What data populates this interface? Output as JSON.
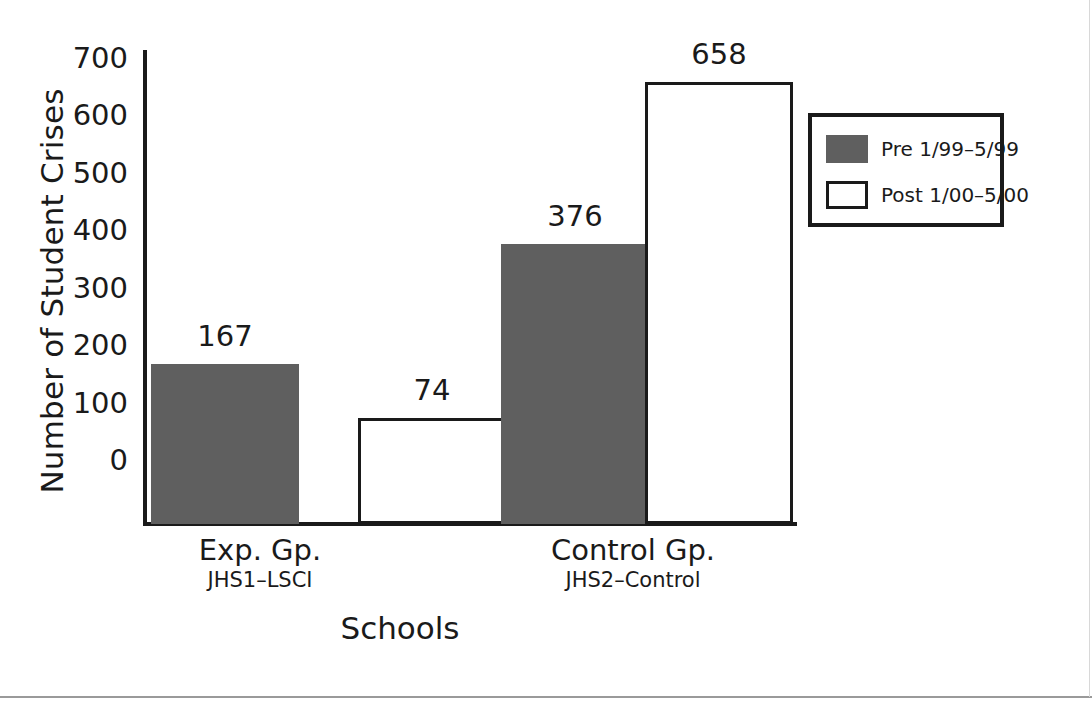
{
  "chart_data": {
    "type": "bar",
    "title": "",
    "xlabel": "Schools",
    "ylabel": "Number of Student Crises",
    "ylim": [
      0,
      700
    ],
    "ytick_step": 100,
    "yticks": [
      "700",
      "600",
      "500",
      "400",
      "300",
      "200",
      "100",
      "0"
    ],
    "grid": false,
    "legend_position": "upper-right",
    "categories": [
      "Exp. Gp.",
      "Control Gp."
    ],
    "category_sublabels": [
      "JHS1–LSCI",
      "JHS2–Control"
    ],
    "series": [
      {
        "name": "Pre 1/99–5/99",
        "values": [
          167,
          376
        ],
        "color": "#5f5f5f",
        "style": "filled"
      },
      {
        "name": "Post 1/00–5/00",
        "values": [
          74,
          658
        ],
        "color": "#ffffff",
        "style": "outlined"
      }
    ],
    "bars": [
      {
        "group": "Exp. Gp.",
        "series": "Pre 1/99–5/99",
        "value": 167,
        "label": "167"
      },
      {
        "group": "Exp. Gp.",
        "series": "Post 1/00–5/00",
        "value": 74,
        "label": "74"
      },
      {
        "group": "Control Gp.",
        "series": "Pre 1/99–5/99",
        "value": 376,
        "label": "376"
      },
      {
        "group": "Control Gp.",
        "series": "Post 1/00–5/00",
        "value": 658,
        "label": "658"
      }
    ]
  },
  "legend": {
    "items": [
      {
        "label": "Pre 1/99–5/99",
        "swatch": "gray-filled-swatch"
      },
      {
        "label": "Post 1/00–5/00",
        "swatch": "white-outlined-swatch"
      }
    ]
  },
  "colors": {
    "pre_fill": "#5f5f5f",
    "post_fill": "#ffffff",
    "axis": "#1a1a1a",
    "text": "#1a1a1a",
    "rule": "#9a9a9a"
  }
}
